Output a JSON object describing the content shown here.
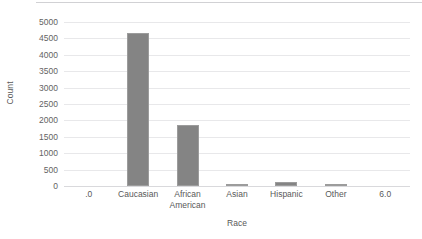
{
  "chart_data": {
    "type": "bar",
    "title": "",
    "xlabel": "Race",
    "ylabel": "Count",
    "categories": [
      ".0",
      "Caucasian",
      "African\nAmerican",
      "Asian",
      "Hispanic",
      "Other",
      "6.0"
    ],
    "values": [
      0,
      4680,
      1850,
      55,
      125,
      50,
      0
    ],
    "ylim": [
      0,
      5000
    ],
    "ytick_labels": [
      "5000",
      "4500",
      "4000",
      "3500",
      "3000",
      "2500",
      "2000",
      "1500",
      "1000",
      "500",
      "0"
    ],
    "ytick_values": [
      5000,
      4500,
      4000,
      3500,
      3000,
      2500,
      2000,
      1500,
      1000,
      500,
      0
    ],
    "grid": true,
    "legend": false,
    "bar_color": "#848484",
    "gridline_color": "#e8e8ea",
    "axis_text_color": "#595959",
    "background_color": "#ffffff"
  }
}
